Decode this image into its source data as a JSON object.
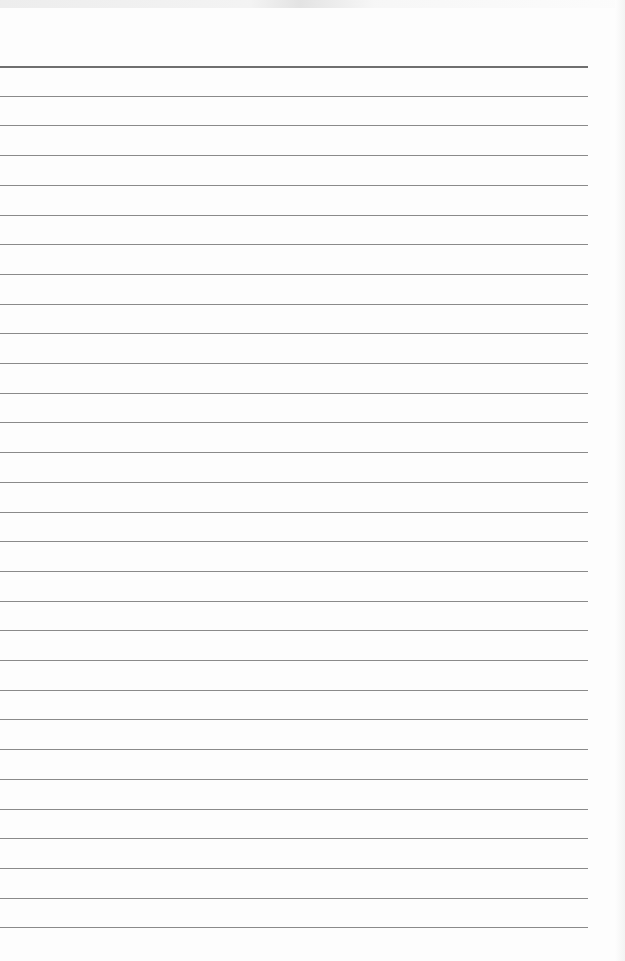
{
  "document": {
    "type": "lined-paper",
    "line_count": 30,
    "first_line_y": 66,
    "line_spacing": 29.7,
    "line_width": 588,
    "line_color": "#8a8a8a",
    "top_line_color": "#6f6f6f",
    "paper_color": "#fdfdfd",
    "text": ""
  }
}
